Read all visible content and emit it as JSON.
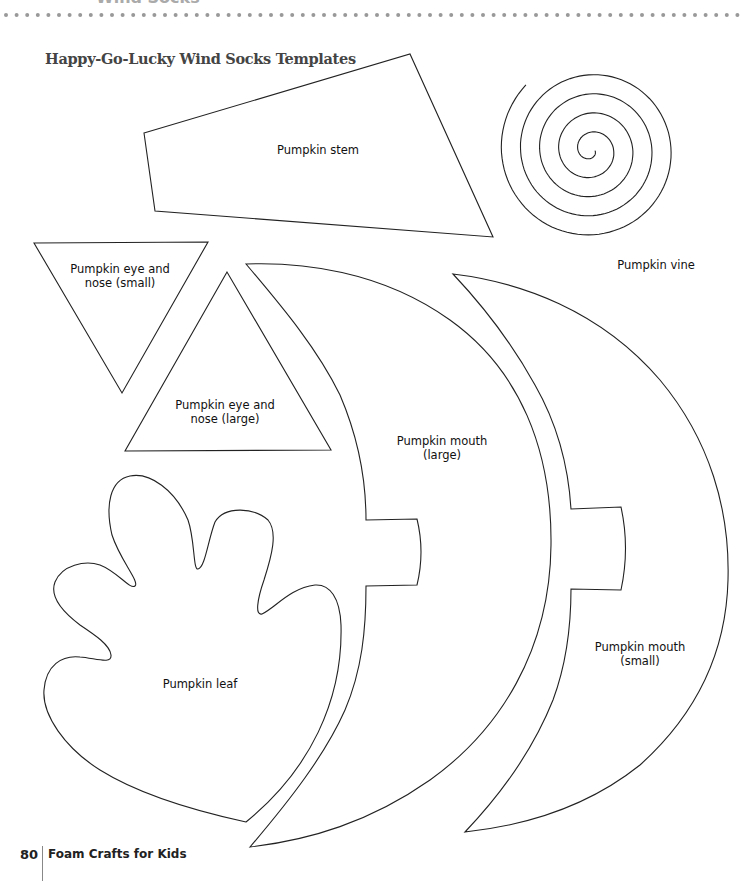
{
  "header": {
    "chapter_title": "Wind Socks",
    "dot_color": "#999999"
  },
  "page_title": "Happy-Go-Lucky Wind Socks Templates",
  "templates": [
    {
      "id": "stem",
      "label": "Pumpkin stem"
    },
    {
      "id": "vine",
      "label": "Pumpkin vine"
    },
    {
      "id": "eye_nose_small",
      "label_line1": "Pumpkin eye and",
      "label_line2": "nose (small)"
    },
    {
      "id": "eye_nose_large",
      "label_line1": "Pumpkin eye and",
      "label_line2": "nose (large)"
    },
    {
      "id": "mouth_large",
      "label_line1": "Pumpkin mouth",
      "label_line2": "(large)"
    },
    {
      "id": "mouth_small",
      "label_line1": "Pumpkin mouth",
      "label_line2": "(small)"
    },
    {
      "id": "leaf",
      "label": "Pumpkin leaf"
    }
  ],
  "footer": {
    "page_number": "80",
    "book_title": "Foam Crafts for Kids"
  }
}
